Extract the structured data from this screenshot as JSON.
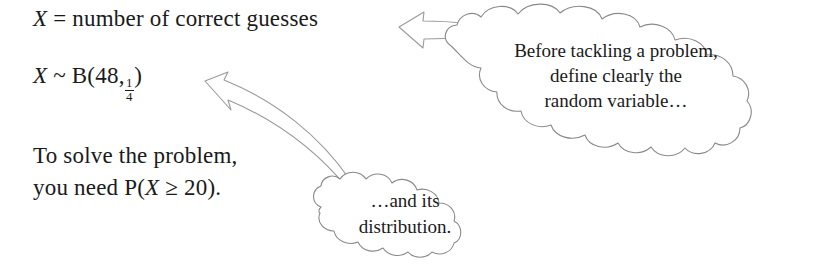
{
  "page": {
    "background_color": "#ffffff",
    "text_color": "#1a1a1a",
    "outline_color": "#8a8a8a",
    "width": 830,
    "height": 267
  },
  "body_text": {
    "definition": {
      "variable": "X",
      "relation": "=",
      "description": "number of correct guesses",
      "full": "X = number of correct guesses"
    },
    "distribution": {
      "variable": "X",
      "relation": "~",
      "family": "B",
      "open_paren": "(",
      "n": "48",
      "comma": ",",
      "p_numerator": "1",
      "p_denominator": "4",
      "close_paren": ")",
      "full": "X ~ B(48, 1/4)"
    },
    "solve": {
      "line1": "To solve the problem,",
      "line2_prefix": "you need P(",
      "line2_variable": "X",
      "line2_operator": "≥",
      "line2_value": "20",
      "line2_suffix": ").",
      "full": "To solve the problem, you need P(X ≥ 20)."
    }
  },
  "callouts": [
    {
      "id": "top-cloud",
      "shape": "cloud",
      "lines": [
        "Before tackling a problem,",
        "define clearly the",
        "random variable…"
      ],
      "arrow": {
        "name": "left-pointing-arrow",
        "direction": "left",
        "style": "outlined",
        "points_to": "X = number of correct guesses"
      }
    },
    {
      "id": "bottom-cloud",
      "shape": "cloud",
      "lines": [
        "…and its",
        "distribution."
      ],
      "arrow": {
        "name": "curved-up-left-arrow",
        "direction": "up-left",
        "style": "outlined-curved",
        "points_to": "X ~ B(48, 1/4)"
      }
    }
  ]
}
